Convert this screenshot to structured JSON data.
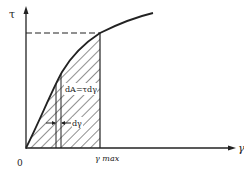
{
  "figure": {
    "y_axis_label": "τ",
    "x_axis_label": "γ",
    "origin_label": "0",
    "x_marker_label": "γ max",
    "strip_area_label": "dA=τdγ",
    "strip_width_label": "dγ"
  },
  "colors": {
    "ink": "#222222",
    "background": "#ffffff"
  }
}
